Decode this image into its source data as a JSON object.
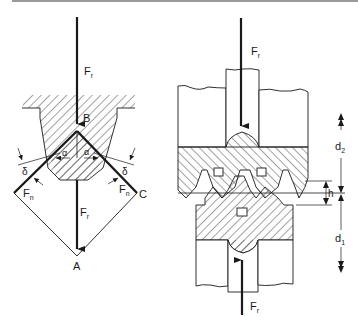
{
  "figure": {
    "left_panel": {
      "title": "thread-flank force triangle",
      "labels": {
        "force_top": "F",
        "force_top_sub": "r",
        "point_b": "B",
        "alpha_left": "α",
        "alpha_right": "α",
        "delta_left": "δ",
        "delta_right": "δ",
        "normal_left": "F",
        "normal_left_sub": "n",
        "normal_right": "F",
        "normal_right_sub": "n",
        "point_c": "C",
        "force_bottom": "F",
        "force_bottom_sub": "r",
        "point_a": "A"
      }
    },
    "right_panel": {
      "title": "threaded joint cross-section",
      "labels": {
        "force_top": "F",
        "force_top_sub": "r",
        "force_bottom": "F",
        "force_bottom_sub": "r",
        "dim_d2": "d",
        "dim_d2_sub": "2",
        "dim_h": "h",
        "dim_d1": "d",
        "dim_d1_sub": "1"
      }
    },
    "colors": {
      "line": "#1a1a1a",
      "hatch": "#333333",
      "top_bar": "#9a9a9a",
      "background": "#ffffff"
    }
  }
}
